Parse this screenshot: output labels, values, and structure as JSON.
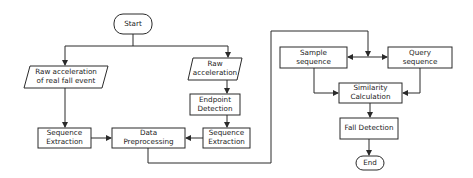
{
  "diagram": {
    "type": "flowchart",
    "colors": {
      "stroke": "#2a2a2a",
      "background": "#ffffff",
      "text": "#222222"
    },
    "nodes": {
      "start": {
        "label": "Start",
        "shape": "terminator"
      },
      "raw_fall": {
        "label": "Raw acceleration\nof  real fall event",
        "shape": "parallelogram"
      },
      "raw_acc": {
        "label": "Raw\nacceleration",
        "shape": "parallelogram"
      },
      "endpoint": {
        "label": "Endpoint\nDetection",
        "shape": "process"
      },
      "seq_right": {
        "label": "Sequence\nExtraction",
        "shape": "process"
      },
      "seq_left": {
        "label": "Sequence\nExtraction",
        "shape": "process"
      },
      "preproc": {
        "label": "Data\nPreprocessing",
        "shape": "process"
      },
      "sample": {
        "label": "Sample\nsequence",
        "shape": "process"
      },
      "query": {
        "label": "Query\nsequence",
        "shape": "process"
      },
      "similarity": {
        "label": "Similarity\nCalculation",
        "shape": "process"
      },
      "fall_detect": {
        "label": "Fall Detection",
        "shape": "process"
      },
      "end": {
        "label": "End",
        "shape": "terminator"
      }
    },
    "edges": [
      [
        "start",
        "raw_fall"
      ],
      [
        "start",
        "raw_acc"
      ],
      [
        "raw_fall",
        "seq_left"
      ],
      [
        "raw_acc",
        "endpoint"
      ],
      [
        "endpoint",
        "seq_right"
      ],
      [
        "seq_left",
        "preproc"
      ],
      [
        "seq_right",
        "preproc"
      ],
      [
        "preproc",
        "sample"
      ],
      [
        "preproc",
        "query"
      ],
      [
        "sample",
        "similarity"
      ],
      [
        "query",
        "similarity"
      ],
      [
        "similarity",
        "fall_detect"
      ],
      [
        "fall_detect",
        "end"
      ]
    ]
  }
}
